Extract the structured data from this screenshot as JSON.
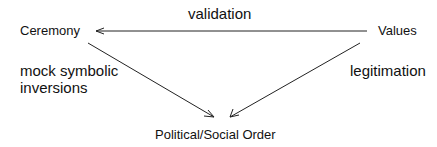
{
  "nodes": {
    "ceremony": "Ceremony",
    "values": "Values",
    "order": "Political/Social Order"
  },
  "edges": {
    "values_to_ceremony": "validation",
    "ceremony_to_order_line1": "mock symbolic",
    "ceremony_to_order_line2": "inversions",
    "values_to_order": "legitimation"
  }
}
